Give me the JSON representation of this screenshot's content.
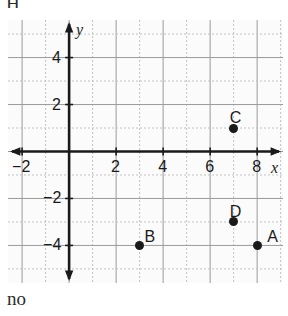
{
  "page": {
    "top_fragment": "H",
    "bottom_caption": "no"
  },
  "chart_data": {
    "type": "scatter",
    "title": "",
    "xlabel": "x",
    "ylabel": "y",
    "xlim": [
      -2.6,
      9.1
    ],
    "ylim": [
      -5.6,
      5.6
    ],
    "x_ticks": [
      -2,
      2,
      4,
      6,
      8
    ],
    "x_tick_labels": [
      "−2",
      "2",
      "4",
      "6",
      "8"
    ],
    "y_ticks": [
      4,
      2,
      -2,
      -4
    ],
    "y_tick_labels": [
      "4",
      "2",
      "−2",
      "−4"
    ],
    "grid": true,
    "grid_major_step": 2,
    "grid_minor_step": 1,
    "legend": "none",
    "axis_arrows": true,
    "points": [
      {
        "label": "A",
        "x": 8,
        "y": -4,
        "label_dx": 10,
        "label_dy": -16
      },
      {
        "label": "B",
        "x": 3,
        "y": -4,
        "label_dx": 5,
        "label_dy": -16
      },
      {
        "label": "C",
        "x": 7,
        "y": 1,
        "label_dx": -4,
        "label_dy": -18
      },
      {
        "label": "D",
        "x": 7,
        "y": -3,
        "label_dx": -4,
        "label_dy": -18
      }
    ]
  },
  "colors": {
    "point": "#1a1a1a",
    "axis": "#1a1a1a",
    "grid_major": "#9a9a9a",
    "grid_minor": "#c2c2c2",
    "background": "#fbfbfb"
  }
}
